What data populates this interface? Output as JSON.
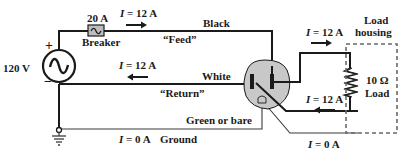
{
  "diagram": {
    "title": "",
    "source": {
      "label": "120 V",
      "plus": "+",
      "minus": "−",
      "icon": "ac-voltage-source-icon"
    },
    "breaker": {
      "rating": "20 A",
      "label": "Breaker",
      "icon": "circuit-breaker-icon"
    },
    "wires": {
      "feed": {
        "color_name": "Black",
        "role": "“Feed”"
      },
      "return": {
        "color_name": "White",
        "role": "“Return”"
      },
      "ground": {
        "color_name": "Green or bare",
        "role": "Ground"
      }
    },
    "currents": {
      "feed": {
        "symbol": "I",
        "value": "= 12 A",
        "direction": "right"
      },
      "return": {
        "symbol": "I",
        "value": "= 12 A",
        "direction": "left"
      },
      "load_top": {
        "symbol": "I",
        "value": "= 12 A",
        "direction": "right"
      },
      "load_bottom": {
        "symbol": "I",
        "value": "= 12 A",
        "direction": "left"
      },
      "ground": {
        "symbol": "I",
        "value": "= 0 A"
      },
      "ground_right": {
        "symbol": "I",
        "value": "= 0 A"
      }
    },
    "load": {
      "resistance": "10 Ω",
      "label": "Load",
      "housing_line1": "Load",
      "housing_line2": "housing",
      "icon": "resistor-icon"
    },
    "outlet": {
      "icon": "outlet-receptacle-icon"
    },
    "ground_symbol": {
      "icon": "ground-icon"
    },
    "colors": {
      "wire": "#1a1a1a",
      "outlet_fill": "#c8c8c8",
      "breaker_fill": "#bdbdbd",
      "housing_dash": "#6a6a6a"
    }
  }
}
